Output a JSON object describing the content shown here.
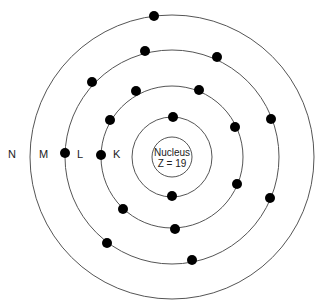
{
  "diagram": {
    "nucleus": {
      "label": "Nucleus",
      "charge": "Z = 19"
    },
    "shells": [
      {
        "name": "K",
        "electrons": 2
      },
      {
        "name": "L",
        "electrons": 8
      },
      {
        "name": "M",
        "electrons": 8
      },
      {
        "name": "N",
        "electrons": 1
      }
    ],
    "colors": {
      "line": "#555555",
      "electron": "#000000",
      "text": "#222222"
    }
  }
}
